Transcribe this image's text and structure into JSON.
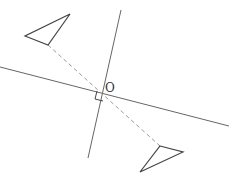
{
  "diagram": {
    "center_label": "O",
    "colors": {
      "line": "#666666",
      "shape": "#444444",
      "dashed": "#9a9a9a",
      "label": "#333333"
    },
    "axis_line": {
      "x1": 0,
      "y1": 67,
      "x2": 229,
      "y2": 126
    },
    "perpendicular_line": {
      "x1": 121,
      "y1": 10,
      "x2": 88,
      "y2": 158
    },
    "dashed_segment": {
      "x1": 48,
      "y1": 45,
      "x2": 160,
      "y2": 146
    },
    "triangle_a": {
      "points": "70,14 25,36 48,45"
    },
    "triangle_b": {
      "points": "160,146 183,152 140,172"
    },
    "right_angle_marker": {
      "points": "97,91 95,99 103,101"
    },
    "center_label_pos": {
      "x": 105,
      "y": 92
    }
  }
}
